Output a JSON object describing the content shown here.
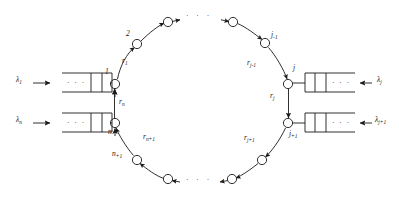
{
  "figure": {
    "type": "ring-queueing-network-diagram",
    "colors": {
      "ink": "#1a1a1a",
      "background": "#ffffff"
    },
    "ring": {
      "center_x": 200,
      "center_y": 101,
      "radius_x": 92,
      "radius_y": 88,
      "direction": "clockwise",
      "node_count_visible": 12
    },
    "nodes": [
      {
        "id": "node-1",
        "label": "1",
        "label_sub": "",
        "x": 115,
        "y": 84
      },
      {
        "id": "node-2",
        "label": "2",
        "label_sub": "",
        "x": 137,
        "y": 44
      },
      {
        "id": "node-3",
        "label": "",
        "label_sub": "",
        "x": 168,
        "y": 22
      },
      {
        "id": "node-4",
        "label": "",
        "label_sub": "",
        "x": 233,
        "y": 22
      },
      {
        "id": "node-j-1",
        "label": "j",
        "label_sub": "-1",
        "x": 265,
        "y": 43
      },
      {
        "id": "node-j",
        "label": "j",
        "label_sub": "",
        "x": 288,
        "y": 84
      },
      {
        "id": "node-j+1",
        "label": "j",
        "label_sub": "+1",
        "x": 288,
        "y": 123
      },
      {
        "id": "node-b1",
        "label": "",
        "label_sub": "",
        "x": 262,
        "y": 160
      },
      {
        "id": "node-b2",
        "label": "",
        "label_sub": "",
        "x": 232,
        "y": 179
      },
      {
        "id": "node-b3",
        "label": "",
        "label_sub": "",
        "x": 168,
        "y": 179
      },
      {
        "id": "node-n+1",
        "label": "n",
        "label_sub": "+1",
        "x": 137,
        "y": 160
      },
      {
        "id": "node-n",
        "label": "n",
        "label_sub": "",
        "x": 115,
        "y": 123
      }
    ],
    "arc_labels": [
      {
        "id": "r-1",
        "label": "r",
        "label_sub": "1",
        "x": 124,
        "y": 62
      },
      {
        "id": "r-j-1",
        "label": "r",
        "label_sub": "j-1",
        "x": 253,
        "y": 64
      },
      {
        "id": "r-j",
        "label": "r",
        "label_sub": "j",
        "x": 272,
        "y": 97
      },
      {
        "id": "r-j+1",
        "label": "r",
        "label_sub": "j+1",
        "x": 250,
        "y": 140
      },
      {
        "id": "r-n",
        "label": "r",
        "label_sub": "n",
        "x": 121,
        "y": 104
      },
      {
        "id": "r-n+1",
        "label": "r",
        "label_sub": "n+1",
        "x": 146,
        "y": 139
      }
    ],
    "ellipses": [
      {
        "id": "ellipsis-top",
        "text": "·  ·  ·",
        "x": 185,
        "y": 16
      },
      {
        "id": "ellipsis-bottom",
        "text": "·  ·  ·",
        "x": 185,
        "y": 183
      }
    ],
    "queues": [
      {
        "id": "queue-1",
        "side": "left",
        "arrival_label": "λ",
        "arrival_sub": "1",
        "arrival_x": 18,
        "arrival_y": 80,
        "box_x": 62,
        "box_y": 73,
        "box_w": 50,
        "box_h": 19,
        "buffer_dots": "· · ·",
        "attached_node": "node-1"
      },
      {
        "id": "queue-n",
        "side": "left",
        "arrival_label": "λ",
        "arrival_sub": "n",
        "arrival_x": 18,
        "arrival_y": 120,
        "box_x": 62,
        "box_y": 113,
        "box_w": 50,
        "box_h": 19,
        "buffer_dots": "· · ·",
        "attached_node": "node-n"
      },
      {
        "id": "queue-j",
        "side": "right",
        "arrival_label": "λ",
        "arrival_sub": "j",
        "arrival_x": 377,
        "arrival_y": 80,
        "box_x": 305,
        "box_y": 73,
        "box_w": 50,
        "box_h": 19,
        "buffer_dots": "· · ·",
        "attached_node": "node-j"
      },
      {
        "id": "queue-j+1",
        "side": "right",
        "arrival_label": "λ",
        "arrival_sub": "j+1",
        "arrival_x": 373,
        "arrival_y": 120,
        "box_x": 305,
        "box_y": 113,
        "box_w": 50,
        "box_h": 19,
        "buffer_dots": "· · ·",
        "attached_node": "node-j+1"
      }
    ]
  }
}
